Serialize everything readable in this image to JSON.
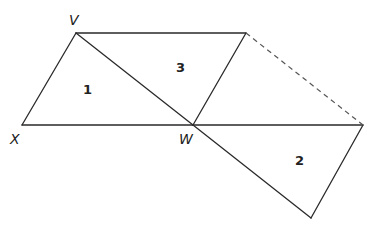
{
  "diagram": {
    "vertices": {
      "V": {
        "label": "V",
        "x": 76,
        "y": 33
      },
      "X": {
        "label": "X",
        "x": 22,
        "y": 125
      },
      "W": {
        "label": "W",
        "x": 193,
        "y": 125
      },
      "T": {
        "label": "",
        "x": 246,
        "y": 33
      },
      "R": {
        "label": "",
        "x": 363,
        "y": 125
      },
      "B": {
        "label": "",
        "x": 311,
        "y": 218
      }
    },
    "vertex_labels": [
      {
        "text": "V",
        "x": 69,
        "y": 25
      },
      {
        "text": "X",
        "x": 10,
        "y": 144
      },
      {
        "text": "W",
        "x": 179,
        "y": 144
      }
    ],
    "regions": [
      {
        "id": "1",
        "label": "1",
        "x": 87,
        "y": 94
      },
      {
        "id": "3",
        "label": "3",
        "x": 180,
        "y": 72
      },
      {
        "id": "2",
        "label": "2",
        "x": 299,
        "y": 165
      }
    ],
    "solid_edges": [
      [
        "V",
        "X"
      ],
      [
        "X",
        "W"
      ],
      [
        "V",
        "W"
      ],
      [
        "V",
        "T"
      ],
      [
        "T",
        "W"
      ],
      [
        "W",
        "R"
      ],
      [
        "R",
        "B"
      ],
      [
        "W",
        "B"
      ]
    ],
    "dashed_edges": [
      [
        "T",
        "R"
      ]
    ]
  }
}
